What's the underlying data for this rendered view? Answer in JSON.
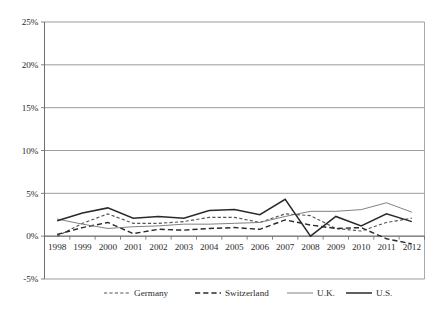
{
  "chart_data": {
    "type": "line",
    "title": "",
    "xlabel": "",
    "ylabel": "",
    "x": [
      1998,
      1999,
      2000,
      2001,
      2002,
      2003,
      2004,
      2005,
      2006,
      2007,
      2008,
      2009,
      2010,
      2011,
      2012
    ],
    "xtick_labels": [
      "1998",
      "1999",
      "2000",
      "2001",
      "2002",
      "2003",
      "2004",
      "2005",
      "2006",
      "2007",
      "2008",
      "2009",
      "2010",
      "2011",
      "2012"
    ],
    "ytick_labels": [
      "25%",
      "20%",
      "15%",
      "10%",
      "5%",
      "0%",
      "-5%"
    ],
    "ytick_values": [
      25,
      20,
      15,
      10,
      5,
      0,
      -5
    ],
    "ylim": [
      -5,
      25
    ],
    "yunit": "percent",
    "grid": "horizontal",
    "legend_position": "bottom",
    "series": [
      {
        "name": "Germany",
        "style": "fine-dashed",
        "color": "#555555",
        "values": [
          0.0,
          1.5,
          2.6,
          1.5,
          1.5,
          1.7,
          2.2,
          2.2,
          1.6,
          2.6,
          2.4,
          0.9,
          0.6,
          1.6,
          2.1
        ]
      },
      {
        "name": "Switzerland",
        "style": "dashed",
        "color": "#2a2a2a",
        "values": [
          0.2,
          1.0,
          1.6,
          0.3,
          0.8,
          0.7,
          0.9,
          1.0,
          0.8,
          1.9,
          1.3,
          0.9,
          1.0,
          -0.3,
          -0.9
        ]
      },
      {
        "name": "U.K.",
        "style": "solid-thin",
        "color": "#7a7a7a",
        "values": [
          2.0,
          1.4,
          0.9,
          1.1,
          1.2,
          1.4,
          1.4,
          1.5,
          1.6,
          2.3,
          2.9,
          2.9,
          3.1,
          3.9,
          2.8
        ]
      },
      {
        "name": "U.S.",
        "style": "solid",
        "color": "#2a2a2a",
        "values": [
          1.8,
          2.7,
          3.3,
          2.1,
          2.3,
          2.1,
          3.0,
          3.1,
          2.5,
          4.3,
          0.0,
          2.3,
          1.2,
          2.6,
          1.7
        ]
      }
    ]
  },
  "legend": {
    "items": [
      {
        "label": "Germany"
      },
      {
        "label": "Switzerland"
      },
      {
        "label": "U.K."
      },
      {
        "label": "U.S."
      }
    ]
  }
}
